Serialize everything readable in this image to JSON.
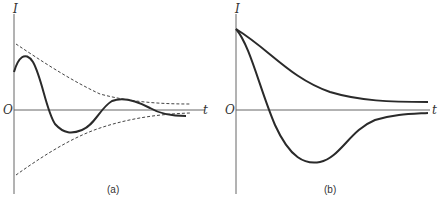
{
  "panels": [
    {
      "id": "a",
      "caption": "(a)",
      "y_label": "I",
      "x_label": "t",
      "origin_label": "O",
      "description": "Damped oscillation with dashed exponential envelopes"
    },
    {
      "id": "b",
      "caption": "(b)",
      "y_label": "I",
      "x_label": "t",
      "origin_label": "O",
      "description": "Overdamped decay and critically damped undershoot curves"
    }
  ],
  "colors": {
    "curve": "#2a2a2a",
    "axis": "#555555",
    "envelope": "#444444"
  }
}
